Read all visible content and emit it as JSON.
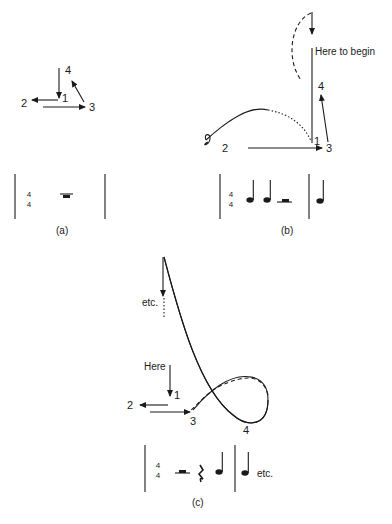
{
  "panels": {
    "a": {
      "caption": "(a)",
      "beats": [
        "1",
        "2",
        "3",
        "4"
      ],
      "time_signature": {
        "top": "4",
        "bottom": "4"
      },
      "notation": [
        "whole rest"
      ]
    },
    "b": {
      "caption": "(b)",
      "beats": [
        "1",
        "2",
        "3",
        "4"
      ],
      "annotation": "Here to begin",
      "time_signature": {
        "top": "4",
        "bottom": "4"
      },
      "notation": [
        "quarter note",
        "quarter note",
        "half rest",
        "barline",
        "quarter note"
      ]
    },
    "c": {
      "caption": "(c)",
      "beats": [
        "1",
        "2",
        "3",
        "4"
      ],
      "annotation_start": "Here",
      "annotation_continue": "etc.",
      "time_signature": {
        "top": "4",
        "bottom": "4"
      },
      "notation": [
        "half rest",
        "quarter rest",
        "quarter note",
        "barline",
        "quarter note"
      ],
      "notation_continue": "etc."
    }
  },
  "colors": {
    "ink": "#1a1a1a",
    "background": "#ffffff"
  }
}
